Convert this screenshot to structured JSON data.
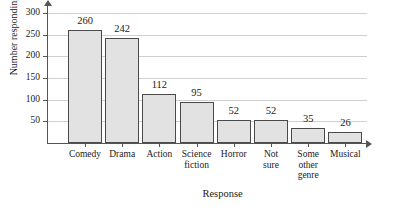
{
  "chart_data": {
    "type": "bar",
    "title": "",
    "xlabel": "Response",
    "ylabel": "Number responding",
    "categories": [
      "Comedy",
      "Drama",
      "Action",
      "Science fiction",
      "Horror",
      "Not sure",
      "Some other genre",
      "Musical"
    ],
    "category_lines": [
      [
        "Comedy"
      ],
      [
        "Drama"
      ],
      [
        "Action"
      ],
      [
        "Science",
        "fiction"
      ],
      [
        "Horror"
      ],
      [
        "Not",
        "sure"
      ],
      [
        "Some",
        "other",
        "genre"
      ],
      [
        "Musical"
      ]
    ],
    "values": [
      260,
      242,
      112,
      95,
      52,
      52,
      35,
      26
    ],
    "value_labels": [
      "260",
      "242",
      "112",
      "95",
      "52",
      "52",
      "35",
      "26"
    ],
    "ylim": [
      0,
      310
    ],
    "yticks": [
      50,
      100,
      150,
      200,
      250,
      300
    ],
    "ytick_labels": [
      "50",
      "100",
      "150",
      "200",
      "250",
      "300"
    ],
    "grid": true,
    "legend": "none",
    "colors": {
      "bar_fill": "#e2e2e2",
      "bar_stroke": "#4a4a4a",
      "axis": "#555555",
      "gridline": "#cfcfcf",
      "text": "#1a1a1a",
      "background": "#ffffff"
    }
  }
}
